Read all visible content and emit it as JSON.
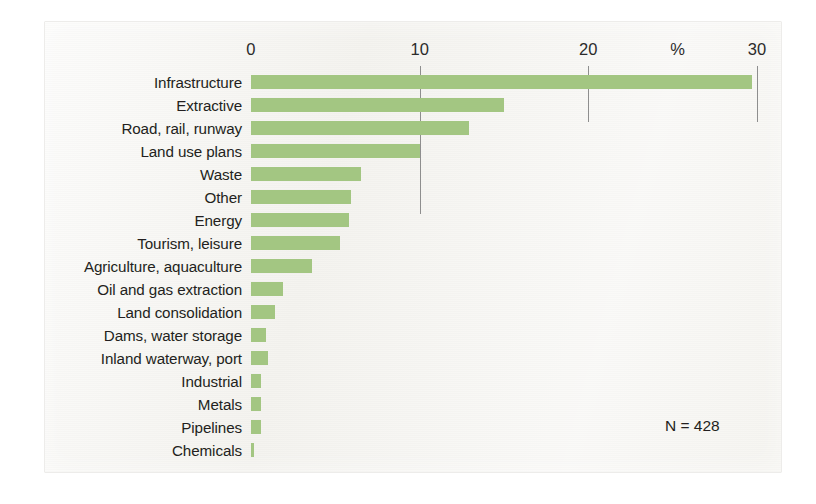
{
  "figure": {
    "annotation": "N = 428",
    "accent_color": "#a3c682",
    "panel_color": "#f4f3ef",
    "text_color": "#231f20",
    "gridline_color": "#8e8e8e"
  },
  "chart_data": {
    "type": "bar",
    "orientation": "horizontal",
    "title": "",
    "subtitle": "",
    "xlabel": "%",
    "ylabel": "",
    "xlim": [
      0,
      30
    ],
    "xticks": [
      0,
      10,
      20,
      30
    ],
    "xtick_labels": [
      "0",
      "10",
      "20",
      "30"
    ],
    "unit_label": "%",
    "grid": true,
    "legend": null,
    "annotations": [
      "N = 428"
    ],
    "categories": [
      "Infrastructure",
      "Extractive",
      "Road, rail, runway",
      "Land use plans",
      "Waste",
      "Other",
      "Energy",
      "Tourism, leisure",
      "Agriculture, aquaculture",
      "Oil and gas extraction",
      "Land consolidation",
      "Dams, water storage",
      "Inland waterway, port",
      "Industrial",
      "Metals",
      "Pipelines",
      "Chemicals"
    ],
    "values": [
      29.7,
      15.0,
      12.9,
      10.0,
      6.5,
      5.9,
      5.8,
      5.3,
      3.6,
      1.9,
      1.4,
      0.9,
      1.0,
      0.6,
      0.6,
      0.6,
      0.2
    ]
  }
}
